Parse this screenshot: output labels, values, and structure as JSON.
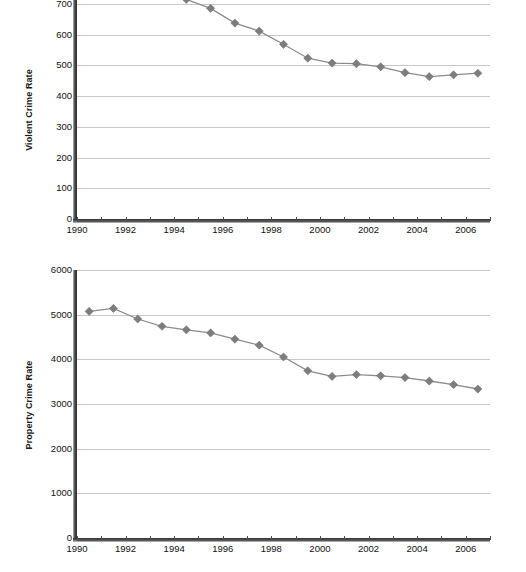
{
  "chart_data": [
    {
      "id": "violent",
      "type": "line",
      "title": "",
      "xlabel": "",
      "ylabel": "Violent Crime Rate",
      "x": [
        1990,
        1991,
        1992,
        1993,
        1994,
        1995,
        1996,
        1997,
        1998,
        1999,
        2000,
        2001,
        2002,
        2003,
        2004,
        2005,
        2006
      ],
      "values": [
        730,
        758,
        758,
        747,
        714,
        685,
        637,
        611,
        568,
        523,
        507,
        505,
        495,
        476,
        463,
        469,
        474
      ],
      "categories": [
        "1990",
        "1991",
        "1992",
        "1993",
        "1994",
        "1995",
        "1996",
        "1997",
        "1998",
        "1999",
        "2000",
        "2001",
        "2002",
        "2003",
        "2004",
        "2005",
        "2006"
      ],
      "y_ticks": [
        0,
        100,
        200,
        300,
        400,
        500,
        600,
        700
      ],
      "y_tick_labels": [
        "0",
        "100",
        "200",
        "300",
        "400",
        "500",
        "600",
        "700"
      ],
      "x_tick_labels": [
        "1990",
        "1992",
        "1994",
        "1996",
        "1998",
        "2000",
        "2002",
        "2004",
        "2006"
      ],
      "x_tick_years": [
        1990,
        1992,
        1994,
        1996,
        1998,
        2000,
        2002,
        2004,
        2006
      ],
      "ylim": [
        0,
        760
      ],
      "xlim": [
        1990,
        2007
      ],
      "grid": true,
      "legend": "none",
      "note": "top of plot is cropped above the 700 gridline"
    },
    {
      "id": "property",
      "type": "line",
      "title": "",
      "xlabel": "",
      "ylabel": "Property Crime Rate",
      "x": [
        1990,
        1991,
        1992,
        1993,
        1994,
        1995,
        1996,
        1997,
        1998,
        1999,
        2000,
        2001,
        2002,
        2003,
        2004,
        2005,
        2006
      ],
      "values": [
        5073,
        5140,
        4903,
        4740,
        4660,
        4591,
        4451,
        4316,
        4052,
        3744,
        3618,
        3658,
        3631,
        3591,
        3514,
        3432,
        3335
      ],
      "categories": [
        "1990",
        "1991",
        "1992",
        "1993",
        "1994",
        "1995",
        "1996",
        "1997",
        "1998",
        "1999",
        "2000",
        "2001",
        "2002",
        "2003",
        "2004",
        "2005",
        "2006"
      ],
      "y_ticks": [
        0,
        1000,
        2000,
        3000,
        4000,
        5000,
        6000
      ],
      "y_tick_labels": [
        "0",
        "1000",
        "2000",
        "3000",
        "4000",
        "5000",
        "6000"
      ],
      "x_tick_labels": [
        "1990",
        "1992",
        "1994",
        "1996",
        "1998",
        "2000",
        "2002",
        "2004",
        "2006"
      ],
      "x_tick_years": [
        1990,
        1992,
        1994,
        1996,
        1998,
        2000,
        2002,
        2004,
        2006
      ],
      "ylim": [
        0,
        6000
      ],
      "xlim": [
        1990,
        2007
      ],
      "grid": true,
      "legend": "none"
    }
  ],
  "style": {
    "marker_color": "#7d7d7d",
    "line_color": "#8c8c8c",
    "gridline_color": "#c8c8c8",
    "axis_color": "#2b2b2b",
    "text_color": "#111111",
    "background": "#ffffff"
  }
}
